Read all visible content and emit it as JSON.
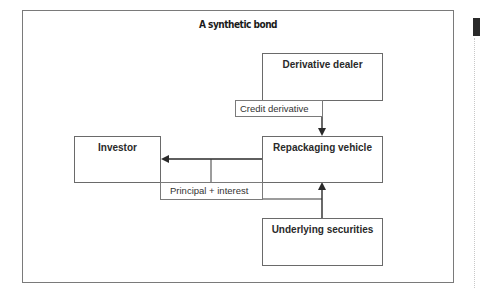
{
  "title": "A synthetic bond",
  "boxes": {
    "derivative_dealer": "Derivative dealer",
    "repackaging_vehicle": "Repackaging vehicle",
    "investor": "Investor",
    "underlying_securities": "Underlying securities"
  },
  "flows": {
    "credit_derivative": "Credit derivative",
    "principal_interest": "Principal + interest"
  },
  "colors": {
    "line": "#3a3a3a",
    "box_border": "#6a6a6a",
    "side_tab": "#2a2a2a"
  }
}
